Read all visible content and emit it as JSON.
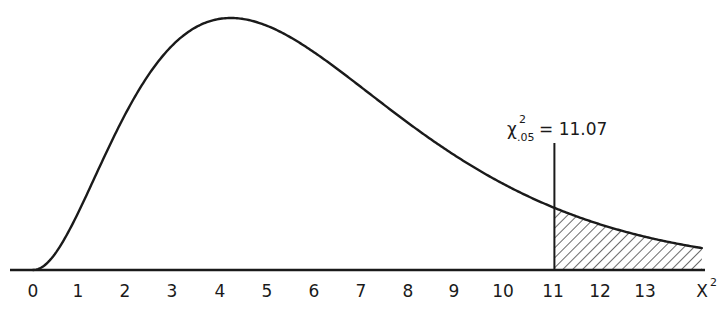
{
  "chart_data": {
    "type": "line",
    "title": "",
    "xlabel": "χ²",
    "ylabel": "",
    "x_ticks": [
      "0",
      "1",
      "2",
      "3",
      "4",
      "5",
      "6",
      "7",
      "8",
      "9",
      "10",
      "11",
      "12",
      "13"
    ],
    "xlim": [
      0,
      14.3
    ],
    "grid": false,
    "legend": null,
    "series": [
      {
        "name": "chi-square density",
        "degrees_of_freedom": 5,
        "x": [
          0,
          1,
          2,
          3,
          4,
          5,
          6,
          7,
          8,
          9,
          10,
          11,
          12,
          13,
          14
        ],
        "values_relative_height": [
          0.0,
          0.3,
          0.75,
          0.95,
          1.0,
          0.96,
          0.84,
          0.68,
          0.52,
          0.38,
          0.26,
          0.18,
          0.11,
          0.07,
          0.04
        ]
      }
    ],
    "annotations": [
      {
        "type": "vertical_line",
        "x": 11.07,
        "label_main": "χ",
        "label_sup": "2",
        "label_sub": ".05",
        "label_value": "= 11.07"
      },
      {
        "type": "shaded_region",
        "from": 11.07,
        "to": 14.3,
        "pattern": "diagonal hatch",
        "meaning": "upper 5% tail"
      }
    ],
    "axis_label_text": "X",
    "axis_label_sup": "2"
  },
  "colors": {
    "ink": "#1a1a1a",
    "background": "#ffffff"
  }
}
